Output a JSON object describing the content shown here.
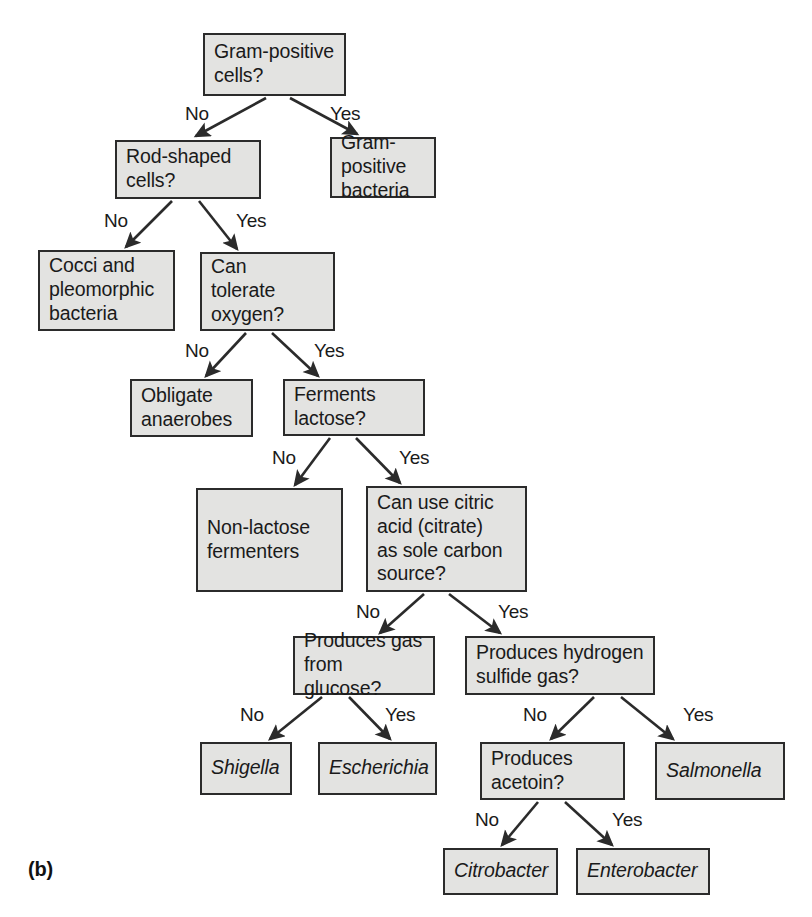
{
  "figure": {
    "panel_label": "(b)",
    "type": "dichotomous-key-flowchart",
    "colors": {
      "box_fill": "#e3e3e1",
      "box_border": "#2b2b2b",
      "text": "#1a1a1a",
      "background": "#ffffff"
    }
  },
  "nodes": [
    {
      "id": "gram_positive_cells",
      "label": "Gram-positive\ncells?",
      "kind": "question",
      "x": 203,
      "y": 33,
      "w": 143,
      "h": 63
    },
    {
      "id": "gram_positive_bact",
      "label": "Gram-positive\nbacteria",
      "kind": "terminal",
      "x": 330,
      "y": 137,
      "w": 106,
      "h": 61
    },
    {
      "id": "rod_shaped_cells",
      "label": "Rod-shaped\ncells?",
      "kind": "question",
      "x": 115,
      "y": 140,
      "w": 146,
      "h": 59
    },
    {
      "id": "cocci_pleomorphic",
      "label": "Cocci and\npleomorphic\nbacteria",
      "kind": "terminal",
      "x": 38,
      "y": 250,
      "w": 137,
      "h": 81
    },
    {
      "id": "tolerate_oxygen",
      "label": "Can\ntolerate\noxygen?",
      "kind": "question",
      "x": 200,
      "y": 252,
      "w": 135,
      "h": 79
    },
    {
      "id": "obligate_anaerobes",
      "label": "Obligate\nanaerobes",
      "kind": "terminal",
      "x": 130,
      "y": 379,
      "w": 123,
      "h": 58
    },
    {
      "id": "ferments_lactose",
      "label": "Ferments\nlactose?",
      "kind": "question",
      "x": 283,
      "y": 379,
      "w": 142,
      "h": 57
    },
    {
      "id": "non_lactose_ferm",
      "label": "Non-lactose\nfermenters",
      "kind": "terminal",
      "x": 196,
      "y": 488,
      "w": 147,
      "h": 104
    },
    {
      "id": "citric_acid",
      "label": "Can use citric\nacid (citrate)\nas sole carbon\nsource?",
      "kind": "question",
      "x": 366,
      "y": 486,
      "w": 161,
      "h": 106
    },
    {
      "id": "gas_from_glucose",
      "label": "Produces gas\nfrom glucose?",
      "kind": "question",
      "x": 293,
      "y": 636,
      "w": 142,
      "h": 59
    },
    {
      "id": "hydrogen_sulfide",
      "label": "Produces hydrogen\nsulfide gas?",
      "kind": "question",
      "x": 465,
      "y": 636,
      "w": 190,
      "h": 59
    },
    {
      "id": "shigella",
      "label": "Shigella",
      "kind": "taxon",
      "x": 200,
      "y": 742,
      "w": 92,
      "h": 53
    },
    {
      "id": "escherichia",
      "label": "Escherichia",
      "kind": "taxon",
      "x": 318,
      "y": 742,
      "w": 119,
      "h": 53
    },
    {
      "id": "produces_acetoin",
      "label": "Produces\nacetoin?",
      "kind": "question",
      "x": 480,
      "y": 742,
      "w": 145,
      "h": 58
    },
    {
      "id": "salmonella",
      "label": "Salmonella",
      "kind": "taxon",
      "x": 655,
      "y": 742,
      "w": 130,
      "h": 58
    },
    {
      "id": "citrobacter",
      "label": "Citrobacter",
      "kind": "taxon",
      "x": 443,
      "y": 848,
      "w": 115,
      "h": 47
    },
    {
      "id": "enterobacter",
      "label": "Enterobacter",
      "kind": "taxon",
      "x": 576,
      "y": 848,
      "w": 134,
      "h": 47
    }
  ],
  "edges": [
    {
      "from": "gram_positive_cells",
      "to": "rod_shaped_cells",
      "answer": "No",
      "x1": 266,
      "y1": 98,
      "x2": 196,
      "y2": 136,
      "lx": 185,
      "ly": 103
    },
    {
      "from": "gram_positive_cells",
      "to": "gram_positive_bact",
      "answer": "Yes",
      "x1": 290,
      "y1": 98,
      "x2": 357,
      "y2": 134,
      "lx": 330,
      "ly": 103
    },
    {
      "from": "rod_shaped_cells",
      "to": "cocci_pleomorphic",
      "answer": "No",
      "x1": 172,
      "y1": 201,
      "x2": 126,
      "y2": 247,
      "lx": 104,
      "ly": 210
    },
    {
      "from": "rod_shaped_cells",
      "to": "tolerate_oxygen",
      "answer": "Yes",
      "x1": 199,
      "y1": 201,
      "x2": 237,
      "y2": 249,
      "lx": 236,
      "ly": 210
    },
    {
      "from": "tolerate_oxygen",
      "to": "obligate_anaerobes",
      "answer": "No",
      "x1": 246,
      "y1": 333,
      "x2": 206,
      "y2": 376,
      "lx": 185,
      "ly": 340
    },
    {
      "from": "tolerate_oxygen",
      "to": "ferments_lactose",
      "answer": "Yes",
      "x1": 272,
      "y1": 333,
      "x2": 318,
      "y2": 376,
      "lx": 314,
      "ly": 340
    },
    {
      "from": "ferments_lactose",
      "to": "non_lactose_ferm",
      "answer": "No",
      "x1": 330,
      "y1": 438,
      "x2": 295,
      "y2": 485,
      "lx": 272,
      "ly": 447
    },
    {
      "from": "ferments_lactose",
      "to": "citric_acid",
      "answer": "Yes",
      "x1": 356,
      "y1": 438,
      "x2": 400,
      "y2": 483,
      "lx": 399,
      "ly": 447
    },
    {
      "from": "citric_acid",
      "to": "gas_from_glucose",
      "answer": "No",
      "x1": 424,
      "y1": 594,
      "x2": 380,
      "y2": 633,
      "lx": 356,
      "ly": 601
    },
    {
      "from": "citric_acid",
      "to": "hydrogen_sulfide",
      "answer": "Yes",
      "x1": 449,
      "y1": 594,
      "x2": 500,
      "y2": 633,
      "lx": 498,
      "ly": 601
    },
    {
      "from": "gas_from_glucose",
      "to": "shigella",
      "answer": "No",
      "x1": 322,
      "y1": 697,
      "x2": 270,
      "y2": 739,
      "lx": 240,
      "ly": 704
    },
    {
      "from": "gas_from_glucose",
      "to": "escherichia",
      "answer": "Yes",
      "x1": 349,
      "y1": 697,
      "x2": 390,
      "y2": 739,
      "lx": 385,
      "ly": 704
    },
    {
      "from": "hydrogen_sulfide",
      "to": "produces_acetoin",
      "answer": "No",
      "x1": 594,
      "y1": 697,
      "x2": 551,
      "y2": 739,
      "lx": 523,
      "ly": 704
    },
    {
      "from": "hydrogen_sulfide",
      "to": "salmonella",
      "answer": "Yes",
      "x1": 621,
      "y1": 697,
      "x2": 673,
      "y2": 739,
      "lx": 683,
      "ly": 704
    },
    {
      "from": "produces_acetoin",
      "to": "citrobacter",
      "answer": "No",
      "x1": 538,
      "y1": 802,
      "x2": 502,
      "y2": 845,
      "lx": 475,
      "ly": 809
    },
    {
      "from": "produces_acetoin",
      "to": "enterobacter",
      "answer": "Yes",
      "x1": 565,
      "y1": 802,
      "x2": 612,
      "y2": 845,
      "lx": 612,
      "ly": 809
    }
  ],
  "panel": {
    "label_x": 28,
    "label_y": 858
  }
}
